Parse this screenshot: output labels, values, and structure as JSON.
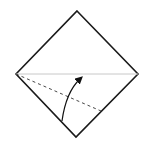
{
  "diagram": {
    "type": "origami-fold-step",
    "colors": {
      "background": "#ffffff",
      "outline": "#1a1a1a",
      "crease": "#c8c8c8",
      "fold_line": "#333333",
      "arrow": "#111111"
    },
    "square": {
      "top": [
        77,
        11
      ],
      "right": [
        138,
        74
      ],
      "bottom": [
        76,
        137
      ],
      "left": [
        16,
        74
      ]
    },
    "crease_line": {
      "from": [
        16,
        74
      ],
      "to": [
        138,
        74
      ]
    },
    "valley_fold_line": {
      "from": [
        16,
        74
      ],
      "to": [
        101,
        111
      ]
    },
    "fold_arrow": {
      "from": [
        62,
        121
      ],
      "control": [
        66,
        92
      ],
      "to": [
        81,
        77
      ]
    }
  }
}
